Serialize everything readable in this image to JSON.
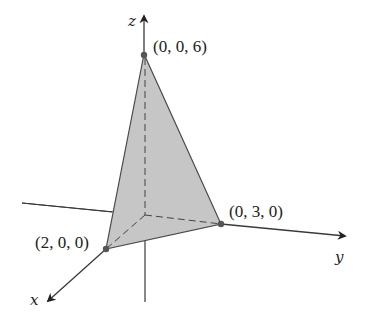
{
  "figure": {
    "colors": {
      "axis": "#3a3a3a",
      "face_fill": "#c6c6c6",
      "face_stroke": "#4a4a4a",
      "vertex": "#555555",
      "dashed": "#444444"
    },
    "axes": {
      "x": {
        "label": "x"
      },
      "y": {
        "label": "y"
      },
      "z": {
        "label": "z"
      }
    },
    "vertices": [
      {
        "id": "x-intercept",
        "label": "(2, 0, 0)",
        "coords": [
          2,
          0,
          0
        ]
      },
      {
        "id": "y-intercept",
        "label": "(0, 3, 0)",
        "coords": [
          0,
          3,
          0
        ]
      },
      {
        "id": "z-intercept",
        "label": "(0, 0, 6)",
        "coords": [
          0,
          0,
          6
        ]
      }
    ]
  }
}
